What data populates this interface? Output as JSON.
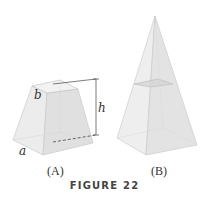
{
  "figure": {
    "title": "FIGURE 22",
    "panels": [
      {
        "id": "A",
        "caption": "(A)",
        "shape": "frustum",
        "labels": {
          "top_side": "b",
          "height": "h",
          "base_side": "a"
        }
      },
      {
        "id": "B",
        "caption": "(B)",
        "shape": "pyramid with horizontal cross-section"
      }
    ],
    "colors": {
      "face_light": "#eeeeee",
      "face_mid": "#e2e2e2",
      "face_dark": "#d6d6d6",
      "edge": "#b8b8b8",
      "dim_line": "#444444",
      "section": "#d0d0d0"
    }
  }
}
